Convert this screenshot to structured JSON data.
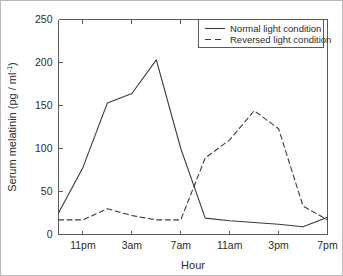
{
  "chart_data": {
    "type": "line",
    "title": "",
    "xlabel": "Hour",
    "ylabel": "Serum melatinin (pg / ml⁻¹)",
    "ylabel_main": "Serum melatinin (pg / ml",
    "ylabel_sup": "-1",
    "ylabel_tail": ")",
    "xlim": [
      21,
      43
    ],
    "ylim": [
      0,
      250
    ],
    "grid": false,
    "legend_position": "top-right",
    "x_tick_labels": [
      "11pm",
      "3am",
      "7am",
      "11am",
      "3pm",
      "7pm"
    ],
    "x_tick_values": [
      23,
      27,
      31,
      35,
      39,
      43
    ],
    "y_tick_labels": [
      "0",
      "50",
      "100",
      "150",
      "200",
      "250"
    ],
    "y_tick_values": [
      0,
      50,
      100,
      150,
      200,
      250
    ],
    "series": [
      {
        "name": "Normal light condition",
        "style": "solid",
        "x": [
          21,
          23,
          25,
          27,
          29,
          31,
          33,
          35,
          39,
          41,
          43
        ],
        "values": [
          25,
          78,
          153,
          164,
          203,
          100,
          19,
          16,
          12,
          9,
          20
        ]
      },
      {
        "name": "Reversed light condition",
        "style": "dashed",
        "x": [
          21,
          23,
          25,
          27,
          29,
          31,
          33,
          35,
          37,
          39,
          41,
          43
        ],
        "values": [
          17,
          17,
          30,
          22,
          17,
          17,
          89,
          110,
          144,
          123,
          33,
          17
        ]
      }
    ]
  },
  "legend": {
    "entries": [
      {
        "label": "Normal light condition",
        "style": "solid"
      },
      {
        "label": "Reversed light condition",
        "style": "dashed"
      }
    ]
  },
  "colors": {
    "line": "#3a3a3a",
    "axis": "#5a5a5a",
    "text": "#2b2b2b",
    "background": "#ffffff",
    "frame": "#b9b9b9"
  }
}
